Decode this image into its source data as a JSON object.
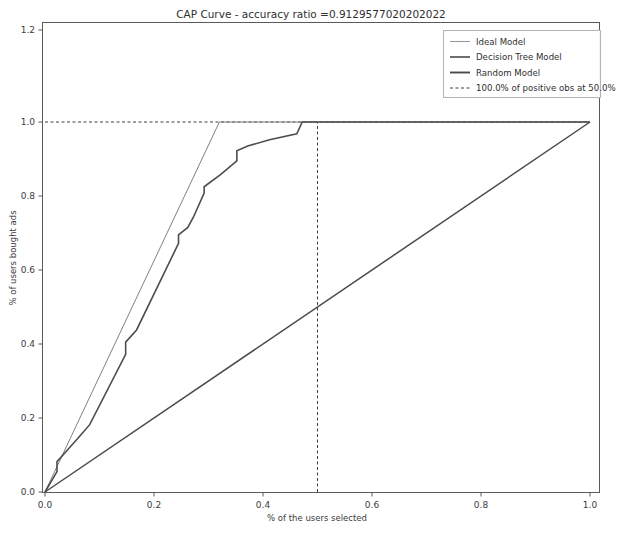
{
  "chart_data": {
    "type": "line",
    "title": "CAP Curve - accuracy ratio =0.9129577020202022",
    "xlabel": "% of the users selected",
    "ylabel": "% of users bought ads",
    "xlim": [
      0.0,
      1.0
    ],
    "ylim": [
      0.0,
      1.28
    ],
    "xticks": [
      "0.0",
      "0.2",
      "0.4",
      "0.6",
      "0.8",
      "1.0"
    ],
    "xtick_values": [
      0.0,
      0.2,
      0.4,
      0.6,
      0.8,
      1.0
    ],
    "yticks": [
      "0.0",
      "0.2",
      "0.4",
      "0.6",
      "0.8",
      "1.0",
      "1.2"
    ],
    "ytick_values": [
      0.0,
      0.2,
      0.4,
      0.6,
      0.8,
      1.0,
      1.2
    ],
    "grid": false,
    "legend_position": "upper right",
    "accuracy_ratio": 0.9129577020202022,
    "annotation": {
      "positive_obs_pct": "100.0%",
      "selected_pct": "50.0%",
      "vline_x": 0.5,
      "hline_y": 1.0
    },
    "series": [
      {
        "name": "Ideal Model",
        "color": "#808080",
        "style": "solid",
        "x": [
          0.0,
          0.32,
          1.0
        ],
        "y": [
          0.0,
          1.0,
          1.0
        ]
      },
      {
        "name": "Decision Tree Model",
        "color": "#4d4d4d",
        "style": "step",
        "x": [
          0.0,
          0.022,
          0.022,
          0.042,
          0.042,
          0.062,
          0.062,
          0.082,
          0.082,
          0.148,
          0.148,
          0.168,
          0.168,
          0.245,
          0.245,
          0.262,
          0.262,
          0.272,
          0.272,
          0.292,
          0.292,
          0.322,
          0.322,
          0.352,
          0.352,
          0.372,
          0.372,
          0.412,
          0.412,
          0.462,
          0.462,
          0.472,
          0.472,
          1.0
        ],
        "y": [
          0.0,
          0.055,
          0.082,
          0.115,
          0.115,
          0.148,
          0.148,
          0.182,
          0.182,
          0.372,
          0.405,
          0.438,
          0.438,
          0.672,
          0.695,
          0.715,
          0.715,
          0.742,
          0.742,
          0.808,
          0.825,
          0.858,
          0.858,
          0.895,
          0.922,
          0.935,
          0.935,
          0.952,
          0.952,
          0.968,
          0.968,
          1.0,
          1.0,
          1.0
        ]
      },
      {
        "name": "Random Model",
        "color": "#4a4a4a",
        "style": "solid",
        "x": [
          0.0,
          1.0
        ],
        "y": [
          0.0,
          1.0
        ]
      }
    ],
    "legend_entries": [
      {
        "label": "Ideal Model",
        "style": "solid-thin"
      },
      {
        "label": "Decision Tree Model",
        "style": "solid-medium"
      },
      {
        "label": "Random Model",
        "style": "solid-thick"
      },
      {
        "label": "100.0% of positive obs at 50.0%",
        "style": "dashed"
      }
    ]
  }
}
